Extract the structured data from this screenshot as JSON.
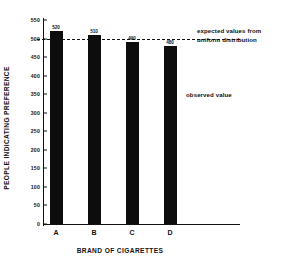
{
  "chart_data": {
    "type": "bar",
    "title": "",
    "categories": [
      "A",
      "B",
      "C",
      "D"
    ],
    "values": [
      520,
      510,
      490,
      480
    ],
    "value_labels": [
      "520",
      "510",
      "490",
      "480"
    ],
    "series": [
      {
        "name": "observed value",
        "values": [
          520,
          510,
          490,
          480
        ]
      }
    ],
    "xlabel": "BRAND OF CIGARETTES",
    "ylabel": "PEOPLE INDICATING PREFERENCE",
    "ylim": [
      0,
      550
    ],
    "ytick_values": [
      0,
      50,
      100,
      150,
      200,
      250,
      300,
      350,
      400,
      450,
      500,
      550
    ],
    "ytick_labels": [
      "0",
      "50",
      "100",
      "150",
      "200",
      "250",
      "300",
      "350",
      "400",
      "450",
      "500",
      "550"
    ],
    "grid": false,
    "legend_position": "inside-right",
    "reference_line": {
      "value": 500,
      "style": "dashed",
      "label": "expected values from uniform distribution"
    },
    "annotations": [
      {
        "text": "expected values from uniform distribution",
        "target": "reference-line"
      },
      {
        "text": "observed value",
        "target": "bars"
      }
    ],
    "bar_color": "#0d0d0d",
    "axis_color": "#111111"
  },
  "annotations": {
    "expected_line_1": "expected values from",
    "expected_line_2": "uniform distribution",
    "observed": "observed value"
  }
}
